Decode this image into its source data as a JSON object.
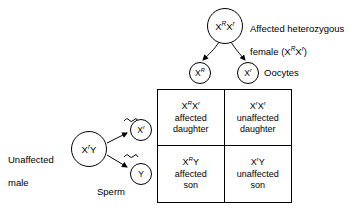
{
  "diagram": {
    "title_hidden": "",
    "mother": {
      "circle_genotype_base1": "X",
      "circle_sup1": "R",
      "circle_base2": "X",
      "circle_sup2": "r",
      "label_line1": "Affected heterozygous",
      "label_line2_pre": "female (X",
      "label_line2_sup1": "R",
      "label_line2_mid": "X",
      "label_line2_sup2": "r",
      "label_line2_post": ")"
    },
    "oocytes": {
      "label": "Oocytes",
      "gamete1_base": "X",
      "gamete1_sup": "R",
      "gamete2_base": "X",
      "gamete2_sup": "r"
    },
    "father": {
      "label_line1": "Unaffected",
      "label_line2": "male",
      "circle_base1": "X",
      "circle_sup1": "r",
      "circle_base2": "Y"
    },
    "sperm": {
      "label": "Sperm",
      "gamete1_base": "X",
      "gamete1_sup": "r",
      "gamete2_base": "Y"
    },
    "punnett": {
      "cells": [
        {
          "position": "top-left",
          "genotype_base1": "X",
          "genotype_sup1": "R",
          "genotype_base2": "X",
          "genotype_sup2": "r",
          "description": "affected\ndaughter"
        },
        {
          "position": "top-right",
          "genotype_base1": "X",
          "genotype_sup1": "r",
          "genotype_base2": "X",
          "genotype_sup2": "r",
          "description": "unaffected\ndaughter"
        },
        {
          "position": "bottom-left",
          "genotype_base1": "X",
          "genotype_sup1": "R",
          "genotype_base2": "Y",
          "genotype_sup2": "",
          "description": "affected\nson"
        },
        {
          "position": "bottom-right",
          "genotype_base1": "X",
          "genotype_sup1": "r",
          "genotype_base2": "Y",
          "genotype_sup2": "",
          "description": "unaffected\nson"
        }
      ]
    },
    "colors": {
      "stroke": "#000000",
      "background": "#ffffff",
      "text": "#000000"
    }
  }
}
